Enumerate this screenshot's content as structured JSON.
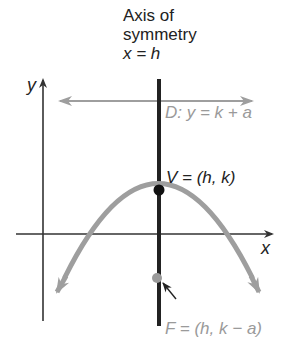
{
  "title": {
    "line1": "Axis of",
    "line2": "symmetry",
    "line3": "x = h"
  },
  "axes": {
    "x_label": "x",
    "y_label": "y"
  },
  "directrix": {
    "label": "D: y = k + a"
  },
  "vertex": {
    "label": "V = (h, k)"
  },
  "focus": {
    "label": "F = (h, k − a)"
  },
  "colors": {
    "axis": "#333333",
    "symmetry_axis": "#222222",
    "parabola": "#9e9e9e",
    "directrix": "#9e9e9e",
    "vertex_point": "#111111",
    "focus_point": "#9a9a9a",
    "muted_text": "#9a9a9a"
  }
}
